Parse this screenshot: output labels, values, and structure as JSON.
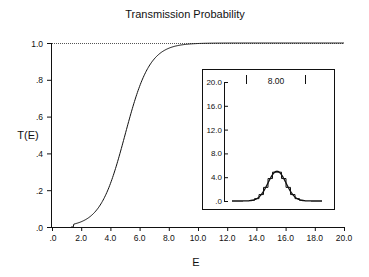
{
  "chart_data": [
    {
      "type": "line",
      "title": "Transmission Probability",
      "xlabel": "E",
      "ylabel": "T(E)",
      "xlim": [
        0,
        20
      ],
      "ylim": [
        0,
        1.0
      ],
      "x_ticks": [
        ".0",
        "2.0",
        "4.0",
        "6.0",
        "8.0",
        "10.0",
        "12.0",
        "14.0",
        "16.0",
        "18.0",
        "20.0"
      ],
      "y_ticks": [
        ".0",
        ".2",
        ".4",
        ".6",
        ".8",
        "1.0"
      ],
      "grid": false,
      "reference_line": {
        "y": 1.0,
        "style": "dotted"
      },
      "series": [
        {
          "name": "T(E)",
          "x": [
            0,
            1.5,
            2.0,
            2.5,
            3.0,
            3.5,
            4.0,
            4.5,
            5.0,
            5.5,
            6.0,
            6.5,
            7.0,
            7.5,
            8.0,
            8.5,
            9.0,
            9.5,
            10.0,
            20.0
          ],
          "y": [
            0.0,
            0.0,
            0.01,
            0.03,
            0.07,
            0.15,
            0.27,
            0.42,
            0.58,
            0.72,
            0.83,
            0.91,
            0.96,
            0.98,
            0.99,
            1.0,
            1.0,
            1.0,
            1.0,
            1.0
          ]
        }
      ]
    },
    {
      "type": "line",
      "title": "",
      "annotation": "8.00",
      "inset": true,
      "ylim": [
        0,
        20
      ],
      "y_ticks": [
        ".0",
        "4.0",
        "8.0",
        "12.0",
        "16.0",
        "20.0"
      ],
      "marker_bars": 2,
      "series": [
        {
          "name": "wave packet",
          "x_rel": [
            -1.0,
            -0.7,
            -0.5,
            -0.4,
            -0.3,
            -0.2,
            -0.1,
            0.0,
            0.1,
            0.2,
            0.3,
            0.4,
            0.5,
            0.7,
            1.0
          ],
          "y": [
            0.0,
            0.05,
            0.4,
            1.1,
            2.2,
            3.5,
            4.6,
            5.0,
            4.6,
            3.5,
            2.2,
            1.1,
            0.4,
            0.05,
            0.0
          ]
        }
      ]
    }
  ]
}
